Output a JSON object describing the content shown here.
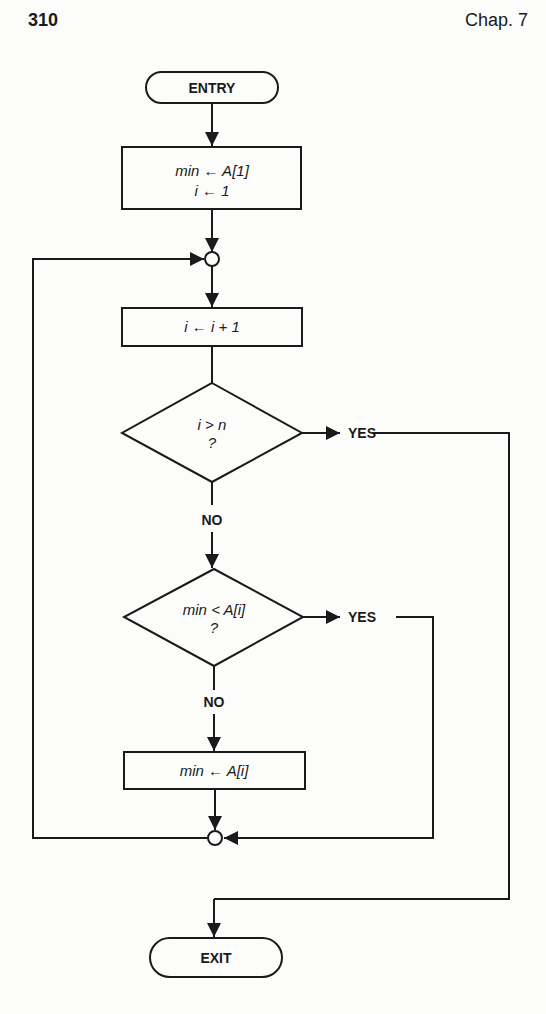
{
  "header": {
    "page_number": "310",
    "chapter": "Chap. 7"
  },
  "flowchart": {
    "entry": "ENTRY",
    "init_line1": "min ← A[1]",
    "init_line2": "i ← 1",
    "increment": "i ← i + 1",
    "decision1_line1": "i > n",
    "decision1_line2": "?",
    "decision1_yes": "YES",
    "decision1_no": "NO",
    "decision2_line1": "min < A[i]",
    "decision2_line2": "?",
    "decision2_yes": "YES",
    "decision2_no": "NO",
    "assign": "min ← A[i]",
    "exit": "EXIT"
  },
  "colors": {
    "ink": "#1a1a1a",
    "paper": "#fcfcfb"
  }
}
